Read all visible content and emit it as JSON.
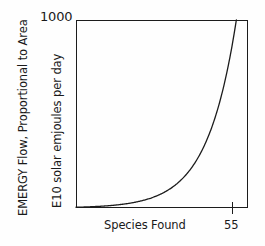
{
  "figure": {
    "background_color": "#fefefe",
    "line_color": "#1c1c1c"
  },
  "axes": {
    "y_top_value": "1000",
    "y_title_outer": "EMERGY Flow, Proportional to Area",
    "y_title_inner": "E10 solar emjoules per day",
    "x_title": "Species Found",
    "x_tick_label": "55"
  },
  "chart_data": {
    "type": "line",
    "title": "",
    "subtitle": "",
    "xlabel": "Species Found",
    "ylabel": "EMERGY Flow, Proportional to Area / E10 solar emjoules per day",
    "xlim": [
      0,
      59
    ],
    "ylim": [
      0,
      1000
    ],
    "grid": false,
    "legend": null,
    "axis_tick_labels": {
      "x": [
        "55"
      ],
      "y": [
        "1000"
      ]
    },
    "annotations": [],
    "series": [
      {
        "name": "EMERGY flow vs species found",
        "description": "Exponential rise from origin reaching 1000 E10 solar emjoules per day at 55 species found",
        "x": [
          0,
          5,
          10,
          15,
          20,
          25,
          30,
          35,
          40,
          45,
          50,
          55
        ],
        "y": [
          4,
          7,
          12,
          21,
          36,
          62,
          107,
          184,
          316,
          543,
          813,
          1000
        ]
      }
    ]
  }
}
